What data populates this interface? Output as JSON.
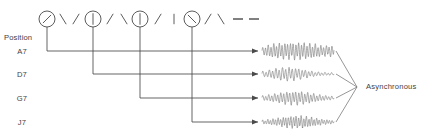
{
  "diagram": {
    "title_label": "Position",
    "right_label": "Asynchronous",
    "row_labels": [
      "A7",
      "D7",
      "G7",
      "J7"
    ],
    "colors": {
      "line": "#4a4a4a",
      "text": "#3f3f3f",
      "wave": "#777777",
      "background": "#ffffff"
    },
    "dials": [
      {
        "name": "dial-1",
        "position_label": "A7",
        "needle": "diagonal-nw-se",
        "cx": 47,
        "cy": 19,
        "r": 8
      },
      {
        "name": "dial-2",
        "position_label": "D7",
        "needle": "vertical",
        "cx": 93,
        "cy": 19,
        "r": 8
      },
      {
        "name": "dial-3",
        "position_label": "G7",
        "needle": "vertical",
        "cx": 140,
        "cy": 19,
        "r": 8
      },
      {
        "name": "dial-4",
        "position_label": "J7",
        "needle": "diagonal-ne-sw",
        "cx": 192,
        "cy": 19,
        "r": 8
      }
    ],
    "ticks": [
      {
        "glyph": "\\",
        "x": 63,
        "y": 19
      },
      {
        "glyph": "/",
        "x": 76,
        "y": 19
      },
      {
        "glyph": "/",
        "x": 110,
        "y": 19
      },
      {
        "glyph": "\\",
        "x": 124,
        "y": 19
      },
      {
        "glyph": "/",
        "x": 158,
        "y": 19
      },
      {
        "glyph": "|",
        "x": 174,
        "y": 19
      },
      {
        "glyph": "/",
        "x": 208,
        "y": 19
      },
      {
        "glyph": "\\",
        "x": 221,
        "y": 19
      }
    ],
    "trailing_dashes": [
      {
        "x1": 233,
        "x2": 243,
        "y": 19
      },
      {
        "x1": 249,
        "x2": 259,
        "y": 19
      }
    ],
    "rows": [
      {
        "label": "A7",
        "label_x": 22,
        "y": 51,
        "stub_x": 47,
        "arrow_x": 258
      },
      {
        "label": "D7",
        "label_x": 22,
        "y": 74,
        "stub_x": 93,
        "arrow_x": 258
      },
      {
        "label": "G7",
        "label_x": 22,
        "y": 98,
        "stub_x": 140,
        "arrow_x": 258
      },
      {
        "label": "J7",
        "label_x": 22,
        "y": 122,
        "stub_x": 192,
        "arrow_x": 258
      }
    ],
    "waveforms": [
      {
        "name": "waveform-a7",
        "row": "A7",
        "x": 262,
        "y": 51,
        "width": 72,
        "amplitude": 11,
        "cycles": 26,
        "envelope": "swell-sustain"
      },
      {
        "name": "waveform-d7",
        "row": "D7",
        "x": 262,
        "y": 74,
        "width": 72,
        "amplitude": 9,
        "cycles": 22,
        "envelope": "burst-decay"
      },
      {
        "name": "waveform-g7",
        "row": "G7",
        "x": 262,
        "y": 98,
        "width": 72,
        "amplitude": 9,
        "cycles": 24,
        "envelope": "swell-decay"
      },
      {
        "name": "waveform-j7",
        "row": "J7",
        "x": 262,
        "y": 122,
        "width": 72,
        "amplitude": 8,
        "cycles": 28,
        "envelope": "noisy-decay"
      }
    ],
    "converge_point": {
      "x": 357,
      "y": 87
    },
    "right_label_pos": {
      "x": 366,
      "y": 89
    },
    "position_label_pos": {
      "x": 4,
      "y": 40
    }
  }
}
